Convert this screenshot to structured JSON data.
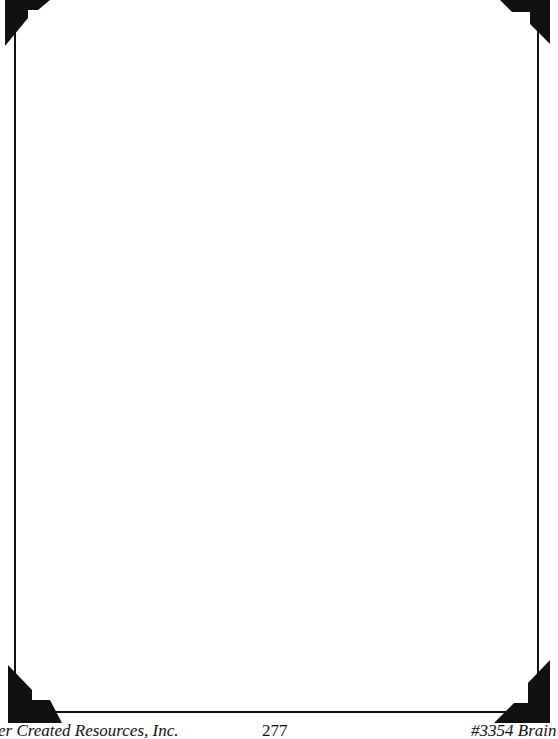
{
  "page": {
    "type": "blank-framed-page",
    "frame_color": "#111111",
    "background": "#ffffff"
  },
  "footer": {
    "left": "er Created Resources, Inc.",
    "center": "277",
    "right": "#3354 Brain"
  },
  "decorations": {
    "corners": [
      "top-left-corner-icon",
      "top-right-corner-icon",
      "bottom-left-corner-icon",
      "bottom-right-corner-icon"
    ]
  }
}
